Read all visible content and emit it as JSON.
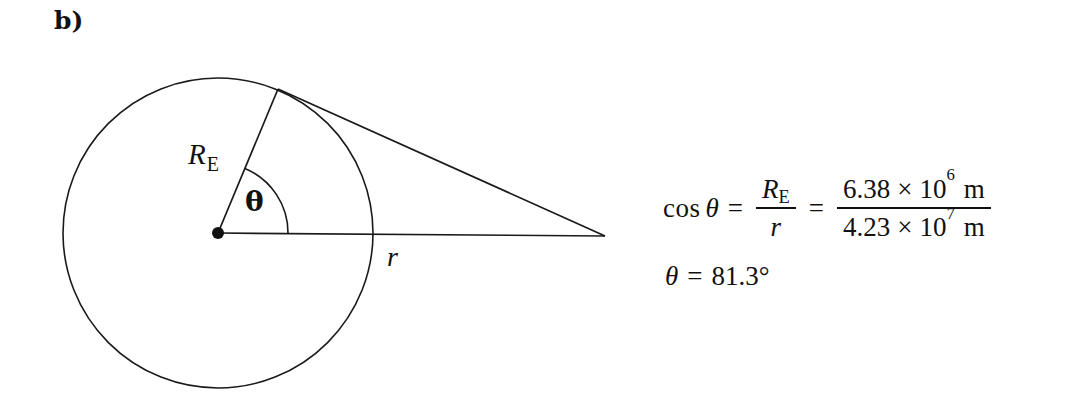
{
  "figure": {
    "part_label": "b)",
    "labels": {
      "radius_symbol": "R",
      "radius_subscript": "E",
      "angle_symbol": "θ",
      "orbit_radius_symbol": "r"
    },
    "geometry": {
      "circle_center_x": 218,
      "circle_center_y": 233,
      "circle_radius": 155,
      "tangent_point_x": 278,
      "tangent_point_y": 89,
      "apex_x": 605,
      "apex_y": 236,
      "center_dot_radius": 6,
      "angle_arc_degrees": "81.3",
      "stroke_color": "#1a1a1a",
      "stroke_width": 1.6
    }
  },
  "equation": {
    "line1": {
      "function": "cos",
      "theta": "θ",
      "equals_1": "=",
      "fraction_1": {
        "numerator_symbol": "R",
        "numerator_subscript": "E",
        "denominator": "r"
      },
      "equals_2": "=",
      "fraction_2": {
        "numerator": {
          "mantissa": "6.38",
          "times": "×",
          "base": "10",
          "exponent": "6",
          "unit": "m"
        },
        "denominator": {
          "mantissa": "4.23",
          "times": "×",
          "base": "10",
          "exponent": "7",
          "unit": "m"
        }
      }
    },
    "line2": {
      "theta": "θ",
      "equals": "=",
      "value": "81.3",
      "degree_symbol": "°"
    }
  }
}
